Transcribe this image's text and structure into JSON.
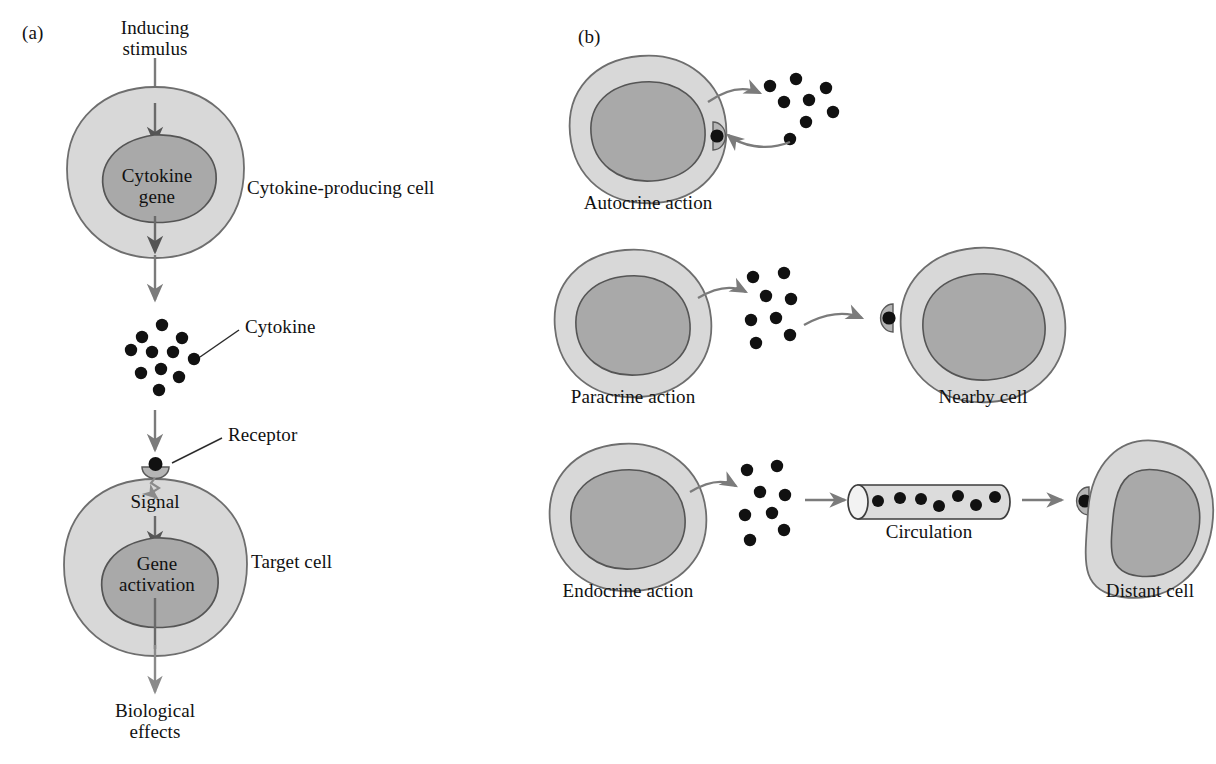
{
  "figure": {
    "background": "#ffffff"
  },
  "colors": {
    "cell_fill": "#d8d8d8",
    "cell_stroke": "#6e6e6e",
    "nucleus_fill": "#a9a9a9",
    "nucleus_stroke": "#555555",
    "dot_fill": "#111111",
    "arrow_gray": "#7b7b7b",
    "arrow_dark": "#4a4a4a",
    "leader_line": "#2b2b2b",
    "vessel_fill": "#dcdcdc",
    "vessel_stroke": "#3d3d3d",
    "text": "#111111"
  },
  "panels": [
    {
      "id": "a",
      "letter": "(a)",
      "labels": {
        "inducing_stimulus": "Inducing\nstimulus",
        "cytokine_gene": "Cytokine\ngene",
        "producing_cell": "Cytokine-producing cell",
        "cytokine": "Cytokine",
        "receptor": "Receptor",
        "signal": "Signal",
        "gene_activation": "Gene\nactivation",
        "target_cell": "Target cell",
        "biological_effects": "Biological\neffects"
      },
      "cytokine_dots": 11
    },
    {
      "id": "b",
      "letter": "(b)",
      "rows": [
        {
          "id": "autocrine",
          "label": "Autocrine action",
          "secondary_label": null,
          "dots": 8,
          "has_receptor": true,
          "return_arrow": true
        },
        {
          "id": "paracrine",
          "label": "Paracrine action",
          "secondary_label": "Nearby cell",
          "dots": 8,
          "has_receptor": true,
          "return_arrow": false
        },
        {
          "id": "endocrine",
          "label": "Endocrine action",
          "secondary_label": "Distant cell",
          "middle_label": "Circulation",
          "dots": 8,
          "vessel_dots": 7,
          "has_receptor": true,
          "return_arrow": false
        }
      ]
    }
  ]
}
